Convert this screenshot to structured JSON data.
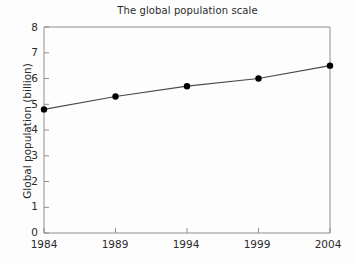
{
  "chart_data": {
    "type": "line",
    "title": "The global population scale",
    "xlabel": "",
    "ylabel": "Global population (billion)",
    "x": [
      1984,
      1989,
      1994,
      1999,
      2004
    ],
    "xticklabels": [
      "1984",
      "1989",
      "1994",
      "1999",
      "2004"
    ],
    "values": [
      4.8,
      5.3,
      5.7,
      6.0,
      6.5
    ],
    "series": [
      {
        "name": "Global population",
        "values": [
          4.8,
          5.3,
          5.7,
          6.0,
          6.5
        ]
      }
    ],
    "yticks": [
      0,
      1,
      2,
      3,
      4,
      5,
      6,
      7,
      8
    ],
    "yticklabels": [
      "0",
      "1",
      "2",
      "3",
      "4",
      "5",
      "6",
      "7",
      "8"
    ],
    "ylim": [
      0,
      8
    ],
    "xlim": [
      1984,
      2004
    ],
    "grid": false,
    "legend": null,
    "marker": "filled-circle",
    "line_color": "#4a4a4a",
    "marker_color": "#000000",
    "axis_color": "#8a8a8a",
    "background_color": "#fdfdfd"
  }
}
